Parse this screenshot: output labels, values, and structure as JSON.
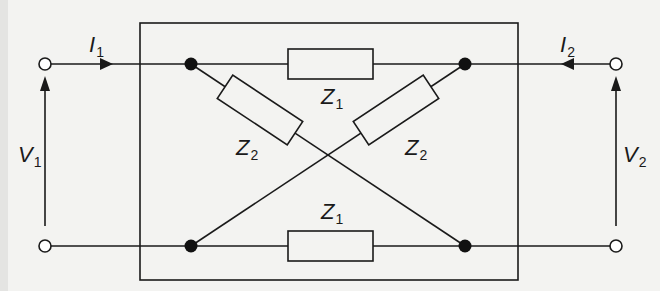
{
  "diagram": {
    "type": "two-port lattice network",
    "colors": {
      "line": "#1a1a1a",
      "background": "#f3f3f1",
      "terminal_fill": "#ffffff"
    },
    "labels": {
      "i1": {
        "symbol": "I",
        "sub": "1"
      },
      "i2": {
        "symbol": "I",
        "sub": "2"
      },
      "v1": {
        "symbol": "V",
        "sub": "1"
      },
      "v2": {
        "symbol": "V",
        "sub": "2"
      },
      "z1_top": {
        "symbol": "Z",
        "sub": "1"
      },
      "z1_bottom": {
        "symbol": "Z",
        "sub": "1"
      },
      "z2_left": {
        "symbol": "Z",
        "sub": "2"
      },
      "z2_right": {
        "symbol": "Z",
        "sub": "2"
      }
    },
    "components": [
      {
        "id": "z1_top",
        "kind": "impedance",
        "label": "Z1",
        "from": "top-left-node",
        "to": "top-right-node"
      },
      {
        "id": "z1_bottom",
        "kind": "impedance",
        "label": "Z1",
        "from": "bottom-left-node",
        "to": "bottom-right-node"
      },
      {
        "id": "z2_left",
        "kind": "impedance",
        "label": "Z2",
        "from": "top-left-node",
        "to": "bottom-right-node"
      },
      {
        "id": "z2_right",
        "kind": "impedance",
        "label": "Z2",
        "from": "top-right-node",
        "to": "bottom-left-node"
      }
    ],
    "ports": [
      {
        "name": "port-1",
        "voltage": "V1",
        "current": "I1",
        "current_direction": "into network"
      },
      {
        "name": "port-2",
        "voltage": "V2",
        "current": "I2",
        "current_direction": "into network"
      }
    ]
  }
}
